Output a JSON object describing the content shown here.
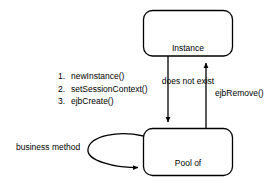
{
  "diagram": {
    "background_color": "#ffffff",
    "stroke_color": "#000000",
    "text_color": "#000000",
    "states": [
      {
        "id": "instance-does-not-exist",
        "lines": "Instance\ndoes not exist",
        "line1": "Instance",
        "line2": "does not exist"
      },
      {
        "id": "pool-of-method-ready-instances",
        "lines": "Pool of\nmethod-ready\ninstances",
        "line1": "Pool of",
        "line2": "method-ready",
        "line3": "instances"
      }
    ],
    "transition_list": [
      {
        "num": "1.",
        "label": "newInstance()"
      },
      {
        "num": "2.",
        "label": "setSessionContext()"
      },
      {
        "num": "3.",
        "label": "ejbCreate()"
      }
    ],
    "edges": [
      {
        "id": "create-edge",
        "label": "",
        "direction": "down"
      },
      {
        "id": "remove-edge",
        "label": "ejbRemove()",
        "direction": "up"
      },
      {
        "id": "business-method-loop",
        "label": "business method",
        "direction": "self-loop"
      }
    ],
    "labels": {
      "ejb_remove": "ejbRemove()",
      "business_method": "business method"
    }
  }
}
